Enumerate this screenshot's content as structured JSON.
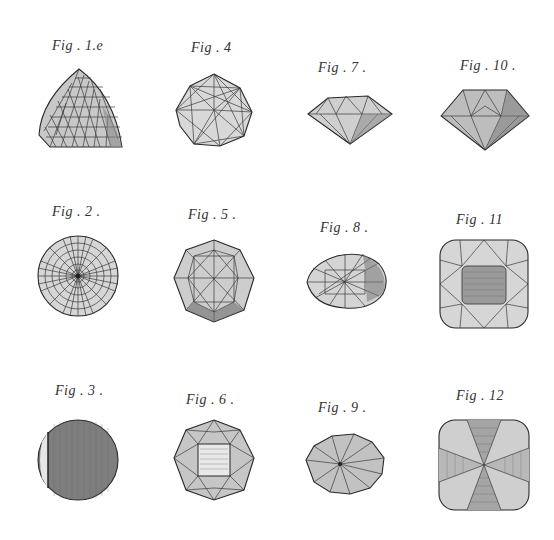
{
  "plate": {
    "background": "#ffffff",
    "ink": "#2a2a2a",
    "figures": [
      {
        "id": "fig-1",
        "label": "Fig . 1.e",
        "shape": "rose-cut-dome"
      },
      {
        "id": "fig-2",
        "label": "Fig . 2 .",
        "shape": "round-radial-dome"
      },
      {
        "id": "fig-3",
        "label": "Fig . 3 .",
        "shape": "round-table-flat"
      },
      {
        "id": "fig-4",
        "label": "Fig . 4",
        "shape": "octagonal-star-top"
      },
      {
        "id": "fig-5",
        "label": "Fig . 5 .",
        "shape": "octagonal-star-top"
      },
      {
        "id": "fig-6",
        "label": "Fig . 6 .",
        "shape": "octagonal-square-table"
      },
      {
        "id": "fig-7",
        "label": "Fig . 7 .",
        "shape": "brilliant-profile"
      },
      {
        "id": "fig-8",
        "label": "Fig . 8 .",
        "shape": "oval-rose-cut"
      },
      {
        "id": "fig-9",
        "label": "Fig . 9 .",
        "shape": "oval-radial-pavilion"
      },
      {
        "id": "fig-10",
        "label": "Fig . 10 .",
        "shape": "brilliant-profile-deep"
      },
      {
        "id": "fig-11",
        "label": "Fig . 11",
        "shape": "cushion-table-top"
      },
      {
        "id": "fig-12",
        "label": "Fig . 12",
        "shape": "cushion-radial-pavilion"
      }
    ]
  }
}
